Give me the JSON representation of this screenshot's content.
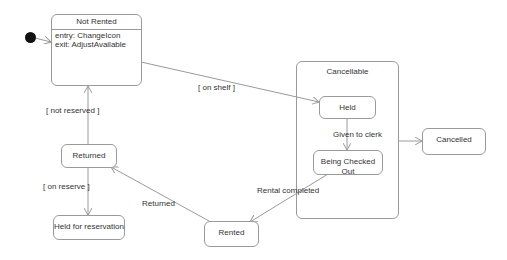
{
  "diagram": {
    "type": "UML state machine",
    "states": {
      "not_rented": {
        "name": "Not Rented",
        "entry": "entry: ChangeIcon",
        "exit": "exit: AdjustAvailable"
      },
      "cancellable": {
        "name": "Cancellable"
      },
      "held": {
        "name": "Held"
      },
      "being_checked_out": {
        "name": "Being Checked Out"
      },
      "cancelled": {
        "name": "Cancelled"
      },
      "returned": {
        "name": "Returned"
      },
      "held_for_reservation": {
        "name": "Held for reservation"
      },
      "rented": {
        "name": "Rented"
      }
    },
    "transitions": {
      "on_shelf": "[ on shelf ]",
      "given_to_clerk": "Given to clerk",
      "rental_completed": "Rental completed",
      "returned": "Returned",
      "not_reserved": "[ not reserved ]",
      "on_reserve": "[ on reserve ]"
    },
    "colors": {
      "line": "#9a9a9a",
      "text": "#333333",
      "initial": "#111111"
    }
  }
}
